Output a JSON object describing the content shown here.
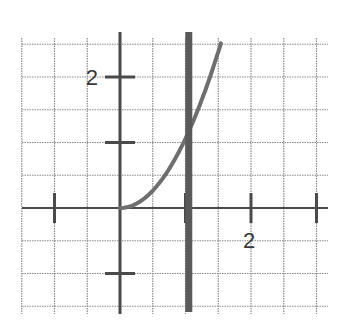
{
  "figure": {
    "x_tick_label": "2",
    "y_tick_label": "2",
    "colors": {
      "grid": "#8a8a8a",
      "axes": "#4a4a4a",
      "curve": "#6e6e6e",
      "vertical_line": "#5a5a5a",
      "background": "#ffffff"
    }
  },
  "chart_data": {
    "type": "line",
    "title": "",
    "xlabel": "",
    "ylabel": "",
    "xlim": [
      -1.5,
      3.0
    ],
    "ylim": [
      -1.5,
      2.5
    ],
    "grid": true,
    "grid_step": 0.5,
    "x_ticks": [
      -1,
      1,
      2,
      3
    ],
    "y_ticks": [
      -1,
      1,
      2
    ],
    "tick_labels": {
      "x": {
        "2": "2"
      },
      "y": {
        "2": "2"
      }
    },
    "series": [
      {
        "name": "y = x^2",
        "x": [
          0,
          0.25,
          0.5,
          0.75,
          1.0,
          1.25,
          1.5,
          1.58
        ],
        "y": [
          0,
          0.0625,
          0.25,
          0.5625,
          1.0,
          1.5625,
          2.25,
          2.5
        ]
      },
      {
        "name": "vertical line",
        "x": [
          1.05,
          1.05
        ],
        "y": [
          -1.5,
          2.5
        ]
      }
    ]
  }
}
